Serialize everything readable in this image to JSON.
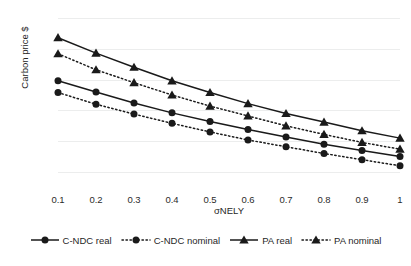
{
  "chart_data": {
    "type": "line",
    "title": "",
    "xlabel": "σNELY",
    "ylabel": "Carbon price $",
    "x": [
      0.1,
      0.2,
      0.3,
      0.4,
      0.5,
      0.6,
      0.7,
      0.8,
      0.9,
      1.0
    ],
    "xticklabels": [
      "0.1",
      "0.2",
      "0.3",
      "0.4",
      "0.5",
      "0.6",
      "0.7",
      "0.8",
      "0.9",
      "1"
    ],
    "yticklabels": [
      "5.0",
      "4.5",
      "4.0",
      "3.5",
      "3.0",
      "2.5"
    ],
    "ytickvalues": [
      5.0,
      4.5,
      4.0,
      3.5,
      3.0,
      2.5
    ],
    "ylim": [
      2.5,
      5.0
    ],
    "xlim": [
      0.1,
      1.0
    ],
    "grid": "horizontal",
    "legend_position": "bottom",
    "series": [
      {
        "name": "C-NDC real",
        "marker": "circle",
        "linestyle": "solid",
        "color": "#1a1a1a",
        "values": [
          3.98,
          3.8,
          3.62,
          3.46,
          3.32,
          3.19,
          3.07,
          2.95,
          2.85,
          2.75
        ]
      },
      {
        "name": "C-NDC nominal",
        "marker": "circle",
        "linestyle": "dotted",
        "color": "#1a1a1a",
        "values": [
          3.79,
          3.6,
          3.44,
          3.29,
          3.15,
          3.02,
          2.91,
          2.8,
          2.7,
          2.6
        ]
      },
      {
        "name": "PA real",
        "marker": "triangle",
        "linestyle": "solid",
        "color": "#1a1a1a",
        "values": [
          4.68,
          4.43,
          4.2,
          3.98,
          3.79,
          3.61,
          3.45,
          3.31,
          3.17,
          3.05
        ]
      },
      {
        "name": "PA nominal",
        "marker": "triangle",
        "linestyle": "dotted",
        "color": "#1a1a1a",
        "values": [
          4.42,
          4.16,
          3.95,
          3.75,
          3.57,
          3.41,
          3.25,
          3.11,
          2.98,
          2.87
        ]
      }
    ]
  },
  "legend": {
    "items": [
      {
        "label": "C-NDC real"
      },
      {
        "label": "C-NDC nominal"
      },
      {
        "label": "PA real"
      },
      {
        "label": "PA nominal"
      }
    ]
  },
  "colors": {
    "ink": "#1a1a1a",
    "gridline": "#eceded",
    "background": "#ffffff"
  }
}
